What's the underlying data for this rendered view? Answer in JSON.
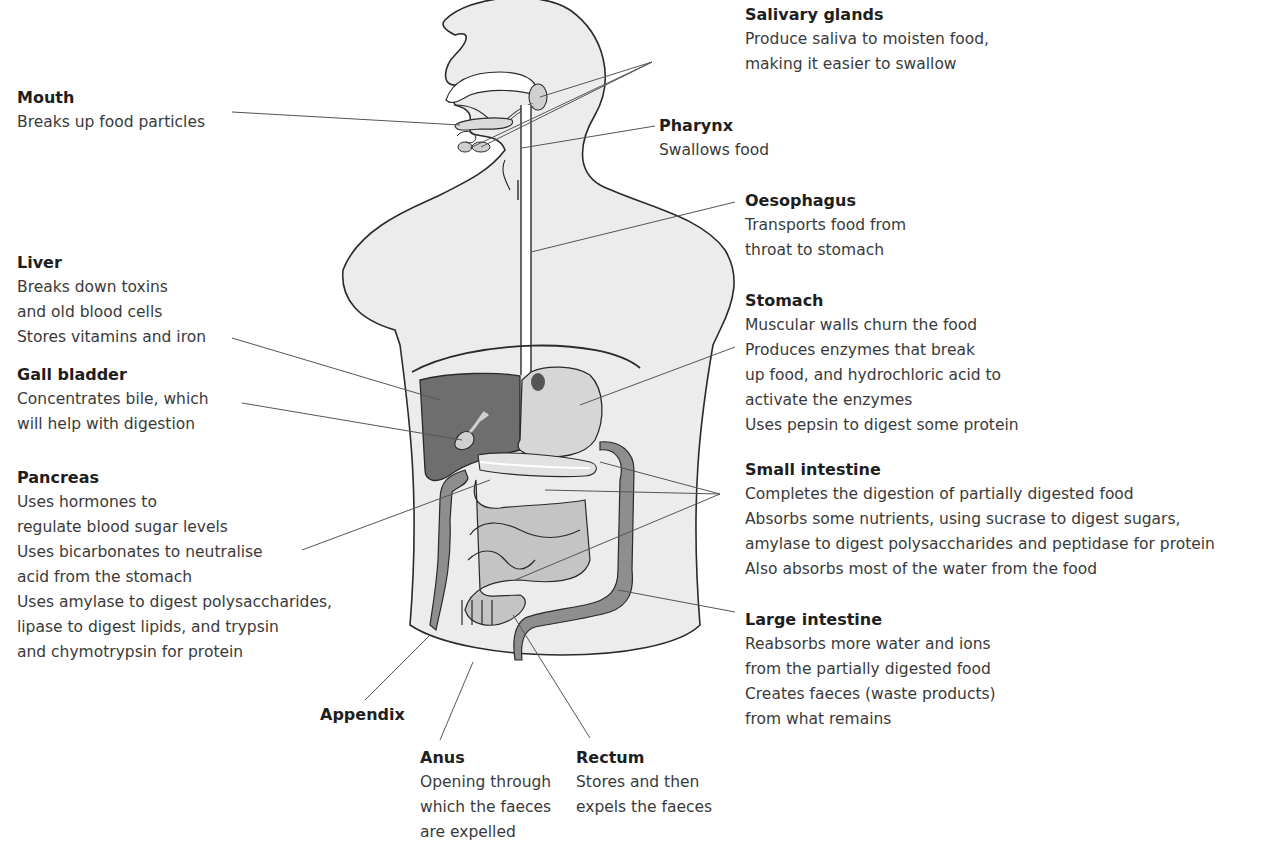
{
  "figure": {
    "colors": {
      "body_fill": "#ececec",
      "outline": "#2a2a2a",
      "liver_fill": "#6e6e6e",
      "stomach_fill": "#d2d2d2",
      "small_intestine_fill": "#c4c4c4",
      "large_intestine_fill": "#8e8e8e",
      "leader_line": "#555555"
    }
  },
  "labels": {
    "mouth": {
      "title": "Mouth",
      "lines": [
        "Breaks up food particles"
      ]
    },
    "salivary": {
      "title": "Salivary glands",
      "lines": [
        "Produce saliva to moisten food,",
        "making it easier to swallow"
      ]
    },
    "pharynx": {
      "title": "Pharynx",
      "lines": [
        "Swallows food"
      ]
    },
    "oesophagus": {
      "title": "Oesophagus",
      "lines": [
        "Transports food from",
        "throat to stomach"
      ]
    },
    "liver": {
      "title": "Liver",
      "lines": [
        "Breaks down toxins",
        "and old blood cells",
        "Stores vitamins and iron"
      ]
    },
    "gall": {
      "title": "Gall bladder",
      "lines": [
        "Concentrates bile, which",
        "will help with digestion"
      ]
    },
    "stomach": {
      "title": "Stomach",
      "lines": [
        "Muscular walls churn the food",
        "Produces enzymes that break",
        "up food, and hydrochloric acid to",
        "activate the enzymes",
        "Uses pepsin to digest some protein"
      ]
    },
    "pancreas": {
      "title": "Pancreas",
      "lines": [
        "Uses hormones to",
        "regulate blood sugar levels",
        "Uses bicarbonates to neutralise",
        "acid from the stomach",
        "Uses amylase to digest polysaccharides,",
        "lipase to digest lipids, and trypsin",
        "and chymotrypsin for protein"
      ]
    },
    "small": {
      "title": "Small intestine",
      "lines": [
        "Completes the digestion of partially digested food",
        "Absorbs some nutrients, using sucrase to digest sugars,",
        "amylase to digest polysaccharides and peptidase for protein",
        "Also absorbs most of the water from the food"
      ]
    },
    "large": {
      "title": "Large intestine",
      "lines": [
        "Reabsorbs more water and ions",
        "from the partially digested food",
        "Creates faeces (waste products)",
        "from what remains"
      ]
    },
    "appendix": {
      "title": "Appendix",
      "lines": []
    },
    "anus": {
      "title": "Anus",
      "lines": [
        "Opening through",
        "which the faeces",
        "are expelled"
      ]
    },
    "rectum": {
      "title": "Rectum",
      "lines": [
        "Stores and then",
        "expels the faeces"
      ]
    }
  }
}
